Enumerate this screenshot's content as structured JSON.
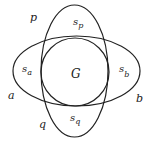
{
  "diagram": {
    "shapes": {
      "vertical_ellipse": {
        "label": "p",
        "lower_label": "q",
        "cx": 74.5,
        "cy": 71,
        "rx": 33.5,
        "ry": 66
      },
      "horizontal_ellipse": {
        "left_label": "a",
        "right_label": "b",
        "cx": 76.5,
        "cy": 71,
        "rx": 63.5,
        "ry": 35
      },
      "circle": {
        "label": "G",
        "cx": 75,
        "cy": 72,
        "r": 34
      }
    },
    "labels": {
      "p": "p",
      "q": "q",
      "a": "a",
      "b": "b",
      "G": "G",
      "s": "s",
      "sub_p": "p",
      "sub_q": "q",
      "sub_a": "a",
      "sub_b": "b"
    },
    "stroke_color": "#222222",
    "background": "#ffffff"
  }
}
